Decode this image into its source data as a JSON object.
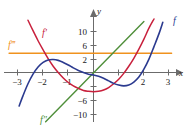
{
  "figure": {
    "name": "derivative-graphs-figure",
    "axis_labels": {
      "x": "x",
      "y": "y"
    }
  },
  "axes": {
    "x_ticks": [
      {
        "value": -3,
        "label": "−3"
      },
      {
        "value": -2,
        "label": "−2"
      },
      {
        "value": -1,
        "label": "−1"
      },
      {
        "value": 1,
        "label": ""
      },
      {
        "value": 2,
        "label": "2"
      },
      {
        "value": 3,
        "label": "3"
      }
    ],
    "y_ticks": [
      {
        "value": 10,
        "label": "10"
      },
      {
        "value": 6,
        "label": "6"
      },
      {
        "value": 2,
        "label": "2"
      },
      {
        "value": -6,
        "label": "−6"
      },
      {
        "value": -10,
        "label": "−10"
      }
    ]
  },
  "curve_labels": {
    "f": "f",
    "fprime": "f′",
    "fdoubleprime": "f″",
    "ftripleprime": "f‴"
  },
  "colors": {
    "f": "#2b3a8f",
    "fprime": "#c8203c",
    "fdoubleprime": "#4f8f3a",
    "ftripleprime": "#f0921e",
    "axis": "#6b6b6b",
    "text": "#1a1a1a"
  },
  "chart_data": {
    "type": "line",
    "title": "",
    "xlabel": "x",
    "ylabel": "y",
    "xlim": [
      -3.4,
      3.4
    ],
    "ylim": [
      -12,
      13
    ],
    "grid": false,
    "legend": "inline-curve-labels",
    "series": [
      {
        "name": "f",
        "label": "f",
        "color": "#2b3a8f",
        "description": "quartic-like curve, local max near x=-1.8 (y=3), local min near x=1.3 (y=-3), rising steeply on both ends",
        "points": [
          [
            -2.95,
            -8.0
          ],
          [
            -2.8,
            -5.6
          ],
          [
            -2.6,
            -2.7
          ],
          [
            -2.4,
            -0.4
          ],
          [
            -2.2,
            1.3
          ],
          [
            -2.0,
            2.4
          ],
          [
            -1.8,
            3.0
          ],
          [
            -1.6,
            3.1
          ],
          [
            -1.4,
            2.9
          ],
          [
            -1.2,
            2.4
          ],
          [
            -1.0,
            1.8
          ],
          [
            -0.8,
            1.1
          ],
          [
            -0.6,
            0.5
          ],
          [
            -0.4,
            0.0
          ],
          [
            -0.2,
            -0.4
          ],
          [
            0.0,
            -0.6
          ],
          [
            0.2,
            -0.9
          ],
          [
            0.4,
            -1.4
          ],
          [
            0.6,
            -2.0
          ],
          [
            0.8,
            -2.6
          ],
          [
            1.0,
            -3.0
          ],
          [
            1.2,
            -3.2
          ],
          [
            1.4,
            -3.0
          ],
          [
            1.6,
            -2.3
          ],
          [
            1.8,
            -1.1
          ],
          [
            2.0,
            0.8
          ],
          [
            2.2,
            3.2
          ],
          [
            2.4,
            6.2
          ],
          [
            2.6,
            9.3
          ],
          [
            2.75,
            12.0
          ]
        ]
      },
      {
        "name": "f'",
        "label": "f′",
        "color": "#c8203c",
        "description": "cubic-like curve, steeply decreasing from upper-left, local min near x=0.2 (y=-4.5), rising to the right",
        "points": [
          [
            -2.6,
            12.5
          ],
          [
            -2.4,
            10.0
          ],
          [
            -2.2,
            7.6
          ],
          [
            -2.0,
            5.4
          ],
          [
            -1.8,
            3.3
          ],
          [
            -1.6,
            1.5
          ],
          [
            -1.4,
            0.0
          ],
          [
            -1.2,
            -1.3
          ],
          [
            -1.0,
            -2.4
          ],
          [
            -0.8,
            -3.2
          ],
          [
            -0.6,
            -3.8
          ],
          [
            -0.4,
            -4.3
          ],
          [
            -0.2,
            -4.5
          ],
          [
            0.0,
            -4.6
          ],
          [
            0.2,
            -4.5
          ],
          [
            0.4,
            -4.2
          ],
          [
            0.6,
            -3.6
          ],
          [
            0.8,
            -2.7
          ],
          [
            1.0,
            -1.6
          ],
          [
            1.2,
            -0.2
          ],
          [
            1.4,
            1.5
          ],
          [
            1.6,
            3.4
          ],
          [
            1.8,
            5.6
          ],
          [
            2.0,
            8.0
          ],
          [
            2.2,
            10.6
          ],
          [
            2.4,
            12.8
          ]
        ]
      },
      {
        "name": "f''",
        "label": "f″",
        "color": "#4f8f3a",
        "description": "straight line, passes through origin region, slope about 6.6, crosses x-axis near x=-0.1",
        "points": [
          [
            -1.9,
            -11.8
          ],
          [
            2.0,
            12.2
          ]
        ]
      },
      {
        "name": "f'''",
        "label": "f‴",
        "color": "#f0921e",
        "description": "horizontal constant line at y = 4.6",
        "points": [
          [
            -3.35,
            4.6
          ],
          [
            3.1,
            4.6
          ]
        ]
      }
    ]
  }
}
